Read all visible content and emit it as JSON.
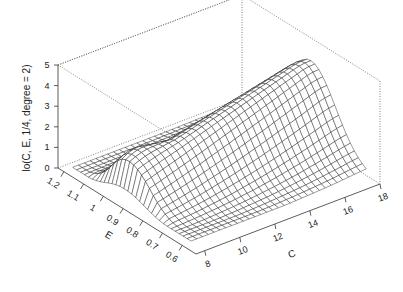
{
  "chart_data": {
    "type": "surface3d",
    "title": "",
    "xlabel": "C",
    "ylabel": "E",
    "zlabel": "lo(C, E, 1/4, degree = 2)",
    "x_ticks": [
      8,
      10,
      12,
      14,
      16,
      18
    ],
    "y_ticks": [
      0.6,
      0.7,
      0.8,
      0.9,
      1,
      1.1,
      1.2
    ],
    "z_ticks": [
      0,
      1,
      2,
      3,
      4,
      5
    ],
    "xlim": [
      7.5,
      18
    ],
    "ylim": [
      0.53,
      1.23
    ],
    "zlim": [
      0,
      5
    ],
    "grid_resolution": [
      30,
      30
    ],
    "surface_description": "Ridge along E≈0.9 rising with C; peak height ~3.9 at C≈18, near-zero at E extremes",
    "box": "dotted back edges",
    "colors": {
      "mesh_line": "#222222",
      "mesh_fill": "#ffffff",
      "box": "#666666",
      "axis": "#333333"
    }
  }
}
